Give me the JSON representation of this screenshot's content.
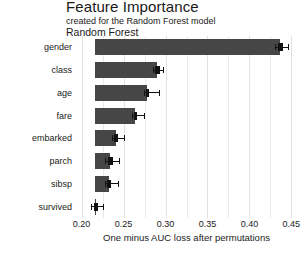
{
  "titles": {
    "main": "Feature Importance",
    "subtitle": "created for the Random Forest model",
    "panel": "Random Forest"
  },
  "axis": {
    "x_title": "One minus AUC loss after permutations",
    "x_ticks": [
      "0.20",
      "0.25",
      "0.30",
      "0.35",
      "0.40",
      "0.45"
    ]
  },
  "labels": {
    "gender": "gender",
    "class": "class",
    "age": "age",
    "fare": "fare",
    "embarked": "embarked",
    "parch": "parch",
    "sibsp": "sibsp",
    "survived": "survived"
  },
  "colors": {
    "bar": "#464646",
    "box": "#111111",
    "grid": "#e9e9e9",
    "background": "#ffffff"
  },
  "chart_data": {
    "type": "bar",
    "orientation": "horizontal",
    "title": "Feature Importance",
    "subtitle": "created for the Random Forest model",
    "panel_label": "Random Forest",
    "xlabel": "One minus AUC loss after permutations",
    "ylabel": "",
    "xlim": [
      0.1945,
      0.4555
    ],
    "xticks": [
      0.2,
      0.25,
      0.3,
      0.35,
      0.4,
      0.45
    ],
    "grid": true,
    "legend": "none",
    "baseline": 0.2155,
    "categories": [
      "gender",
      "class",
      "age",
      "fare",
      "embarked",
      "parch",
      "sibsp",
      "survived"
    ],
    "values": [
      0.4365,
      0.29,
      0.2785,
      0.264,
      0.2405,
      0.234,
      0.2325,
      0.2175
    ],
    "boxplots": [
      {
        "category": "gender",
        "lower_whisker": 0.43,
        "q1": 0.434,
        "median": 0.4365,
        "q3": 0.4395,
        "upper_whisker": 0.446
      },
      {
        "category": "class",
        "lower_whisker": 0.2845,
        "q1": 0.2875,
        "median": 0.29,
        "q3": 0.293,
        "upper_whisker": 0.2975
      },
      {
        "category": "age",
        "lower_whisker": 0.2745,
        "q1": 0.277,
        "median": 0.2785,
        "q3": 0.2805,
        "upper_whisker": 0.2925
      },
      {
        "category": "fare",
        "lower_whisker": 0.26,
        "q1": 0.2625,
        "median": 0.264,
        "q3": 0.2665,
        "upper_whisker": 0.2745
      },
      {
        "category": "embarked",
        "lower_whisker": 0.236,
        "q1": 0.2385,
        "median": 0.2405,
        "q3": 0.243,
        "upper_whisker": 0.25
      },
      {
        "category": "parch",
        "lower_whisker": 0.2275,
        "q1": 0.2315,
        "median": 0.234,
        "q3": 0.237,
        "upper_whisker": 0.245
      },
      {
        "category": "sibsp",
        "lower_whisker": 0.228,
        "q1": 0.2305,
        "median": 0.2325,
        "q3": 0.235,
        "upper_whisker": 0.243
      },
      {
        "category": "survived",
        "lower_whisker": 0.2115,
        "q1": 0.215,
        "median": 0.2175,
        "q3": 0.22,
        "upper_whisker": 0.225
      }
    ]
  }
}
